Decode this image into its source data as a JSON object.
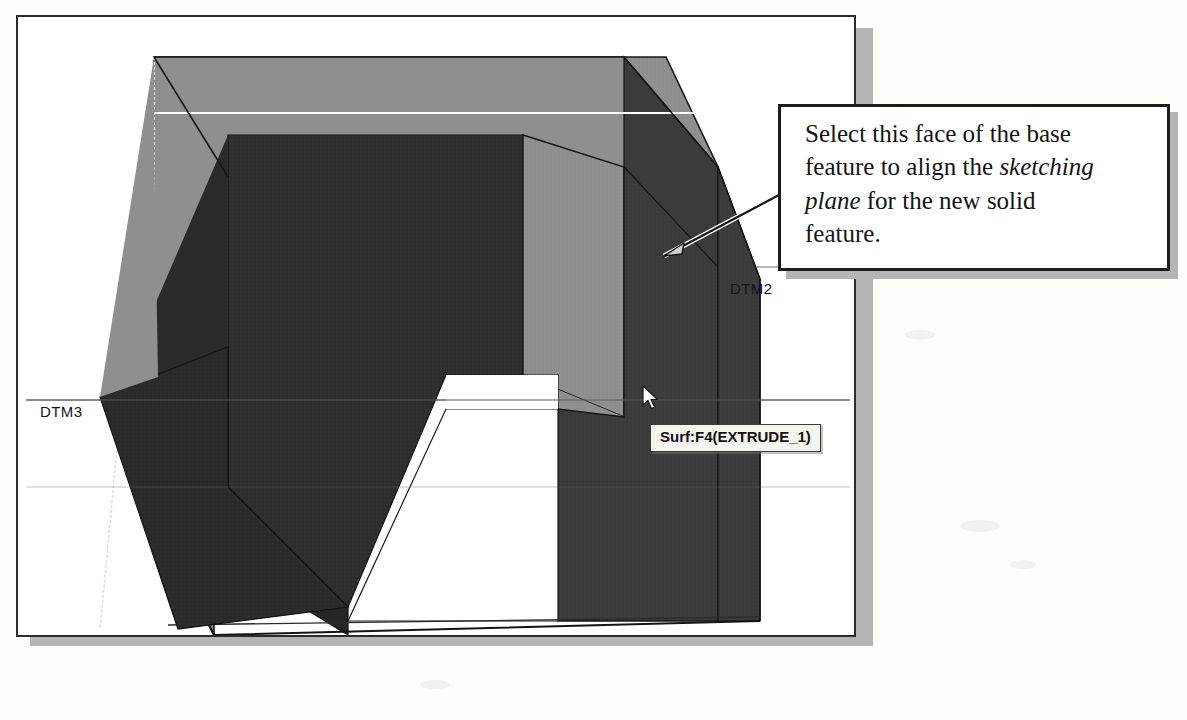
{
  "viewport": {
    "name": "cad-3d-viewport",
    "background": "#ffffff",
    "border_color": "#2b2b2b",
    "shadow_color": "#b4b4b4"
  },
  "model": {
    "description": "Shaded 3D extruded U-channel base feature in isometric view",
    "faces": {
      "top_face_color": "#8b8b8b",
      "left_outer_face_color": "#8b8b8b",
      "inner_cavity_color": "#2f2f2f",
      "right_face_color": "#3f3f3f",
      "highlight_line_color": "#ffffff",
      "edge_color": "#161616"
    },
    "selected_surface": "Surf:F4(EXTRUDE_1)"
  },
  "datum_planes": [
    {
      "id": "dtm3",
      "label": "DTM3"
    },
    {
      "id": "dtm2",
      "label": "DTM2"
    },
    {
      "id": "dtm1",
      "label": "DTM1"
    }
  ],
  "tooltip": {
    "name": "surface-selection-tooltip",
    "text": "Surf:F4(EXTRUDE_1)",
    "background": "#f3f3f0",
    "border_color": "#3a3a3a"
  },
  "cursor": {
    "name": "mouse-pointer",
    "kind": "arrow"
  },
  "callout": {
    "name": "instruction-callout",
    "border_color": "#1c1c1c",
    "background": "#ffffff",
    "shadow_color": "#b4b4b4",
    "lines": [
      {
        "segments": [
          {
            "text": "Select this face of the base",
            "style": "normal"
          }
        ]
      },
      {
        "segments": [
          {
            "text": "feature to align the ",
            "style": "normal"
          },
          {
            "text": "sketching",
            "style": "italic"
          }
        ]
      },
      {
        "segments": [
          {
            "text": "plane",
            "style": "italic"
          },
          {
            "text": " for the new solid",
            "style": "normal"
          }
        ]
      },
      {
        "segments": [
          {
            "text": "feature.",
            "style": "normal"
          }
        ]
      }
    ],
    "plain_text": "Select this face of the base feature to align the sketching plane for the new solid feature.",
    "leader": {
      "name": "callout-leader-arrow",
      "points_to": "right-side-face-of-base-feature"
    }
  }
}
